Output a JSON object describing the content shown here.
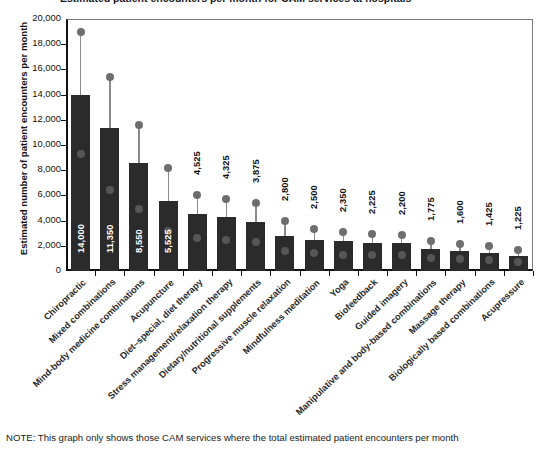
{
  "figure": {
    "clipped_title": "Estimated patient encounters per month for CAM services at hospitals",
    "note": "NOTE: This graph only shows those CAM services where the total estimated patient encounters per month"
  },
  "chart_data": {
    "type": "bar",
    "title": "",
    "xlabel": "",
    "ylabel": "Estimated number of patient encounters per month",
    "ylim": [
      0,
      20000
    ],
    "ytick_labels": [
      "0",
      "2,000",
      "4,000",
      "6,000",
      "8,000",
      "10,000",
      "12,000",
      "14,000",
      "16,000",
      "18,000",
      "20,000"
    ],
    "ytick_values": [
      0,
      2000,
      4000,
      6000,
      8000,
      10000,
      12000,
      14000,
      16000,
      18000,
      20000
    ],
    "grid": false,
    "legend": "none",
    "categories": [
      "Chiropractic",
      "Mixed combinations",
      "Mind-body medicine combinations",
      "Acupuncture",
      "Diet–special, diet therapy",
      "Stress management/relaxation therapy",
      "Dietary/nutritional supplements",
      "Progressive muscle relaxation",
      "Mindfulness meditation",
      "Yoga",
      "Biofeedback",
      "Guided imagery",
      "Manipulative and body-based combinations",
      "Massage therapy",
      "Biologically based combinations",
      "Acupressure"
    ],
    "values": [
      14000,
      11350,
      8550,
      5525,
      4525,
      4325,
      3875,
      2800,
      2500,
      2350,
      2225,
      2200,
      1775,
      1600,
      1425,
      1225
    ],
    "value_labels": [
      "14,000",
      "11,350",
      "8,550",
      "5,525",
      "4,525",
      "4,325",
      "3,875",
      "2,800",
      "2,500",
      "2,350",
      "2,225",
      "2,200",
      "1,775",
      "1,600",
      "1,425",
      "1,225"
    ],
    "upper_markers": [
      19000,
      15400,
      11600,
      8150,
      6000,
      5750,
      5425,
      3950,
      3300,
      3075,
      2900,
      2875,
      2400,
      2175,
      1950,
      1700
    ],
    "lower_markers": [
      9250,
      6400,
      4900,
      3150,
      2600,
      2500,
      2300,
      1550,
      1400,
      1300,
      1250,
      1250,
      1050,
      950,
      850,
      750
    ],
    "series": [
      {
        "name": "Estimated patient encounters per month",
        "values": [
          14000,
          11350,
          8550,
          5525,
          4525,
          4325,
          3875,
          2800,
          2500,
          2350,
          2225,
          2200,
          1775,
          1600,
          1425,
          1225
        ]
      }
    ]
  },
  "style": {
    "bar_color": "#2b2b2b",
    "marker_color": "#6e6e6e",
    "axis_color": "#111111",
    "background": "#ffffff"
  }
}
